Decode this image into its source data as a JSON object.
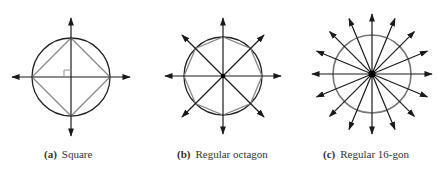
{
  "figure": {
    "panels": [
      {
        "id": "a",
        "tag": "(a)",
        "caption": "Square",
        "polygon_sides": 4,
        "center": [
          71,
          77
        ],
        "radius": 39,
        "axis_length": 59,
        "caption_x": 44
      },
      {
        "id": "b",
        "tag": "(b)",
        "caption": "Regular octagon",
        "polygon_sides": 8,
        "center": [
          223,
          76
        ],
        "radius": 39,
        "axis_length": 58,
        "caption_x": 177
      },
      {
        "id": "c",
        "tag": "(c)",
        "caption": "Regular 16-gon",
        "polygon_sides": 16,
        "center": [
          372,
          74
        ],
        "radius": 39,
        "axis_length": 60,
        "caption_x": 323
      }
    ],
    "colors": {
      "axis": "#1a1a1a",
      "circle": "#222222",
      "polygon": "#888888",
      "circle_16gon": "#777777"
    }
  }
}
